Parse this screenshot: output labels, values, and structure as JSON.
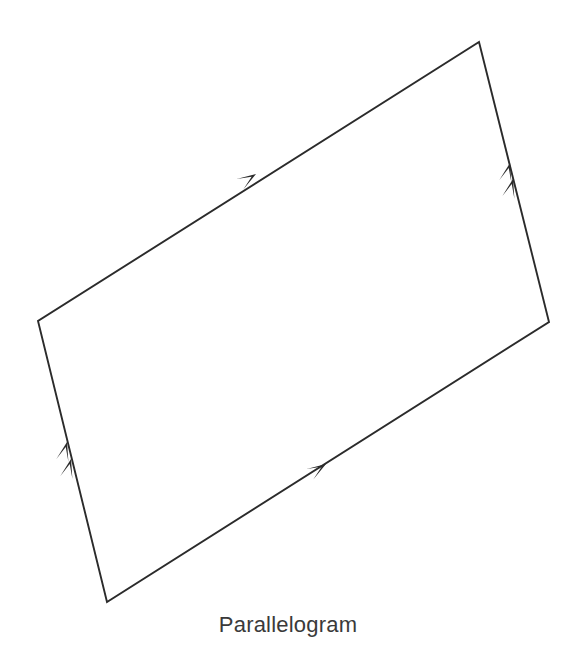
{
  "figure": {
    "caption": "Parallelogram",
    "shape_name": "parallelogram",
    "background_color": "#ffffff",
    "stroke_color": "#2b2b2b",
    "caption_color": "#3a3a3a",
    "stroke_width": 1.9,
    "vertices": [
      {
        "label": "top-right",
        "x": 479,
        "y": 42
      },
      {
        "label": "right",
        "x": 549,
        "y": 322
      },
      {
        "label": "bottom-left",
        "x": 107,
        "y": 602
      },
      {
        "label": "left",
        "x": 38,
        "y": 321
      }
    ],
    "edges": [
      {
        "name": "top-edge",
        "from": "left",
        "to": "top-right",
        "tick_marks": 1,
        "direction": "up-right"
      },
      {
        "name": "right-edge",
        "from": "right",
        "to": "top-right",
        "tick_marks": 2,
        "direction": "up"
      },
      {
        "name": "bottom-edge",
        "from": "bottom-left",
        "to": "right",
        "tick_marks": 1,
        "direction": "up-right"
      },
      {
        "name": "left-edge",
        "from": "bottom-left",
        "to": "left",
        "tick_marks": 2,
        "direction": "up"
      }
    ],
    "arrow_markers": [
      {
        "name": "top-edge-arrow-1",
        "tip_x": 256,
        "tip_y": 174,
        "angle_deg": -32.4
      },
      {
        "name": "bottom-edge-arrow-1",
        "tip_x": 326,
        "tip_y": 464,
        "angle_deg": -32.4
      },
      {
        "name": "right-edge-arrow-1",
        "tip_x": 510,
        "tip_y": 163,
        "angle_deg": -76.0
      },
      {
        "name": "right-edge-arrow-2",
        "tip_x": 513,
        "tip_y": 179,
        "angle_deg": -76.0
      },
      {
        "name": "left-edge-arrow-1",
        "tip_x": 67,
        "tip_y": 442,
        "angle_deg": -76.0
      },
      {
        "name": "left-edge-arrow-2",
        "tip_x": 71,
        "tip_y": 459,
        "angle_deg": -76.0
      }
    ],
    "arrow_length": 19,
    "arrow_half_width": 6.2,
    "arrow_notch": 5.2
  }
}
